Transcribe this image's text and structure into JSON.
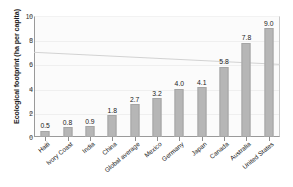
{
  "chart_data": {
    "type": "bar",
    "title": "",
    "xlabel": "",
    "ylabel": "Ecological footprint (ha per capita)",
    "categories": [
      "Haiti",
      "Ivory Coast",
      "India",
      "China",
      "Global average",
      "Mexico",
      "Germany",
      "Japan",
      "Canada",
      "Australia",
      "United States"
    ],
    "values": [
      0.5,
      0.8,
      0.9,
      1.8,
      2.7,
      3.2,
      4.0,
      4.1,
      5.8,
      7.8,
      9.0
    ],
    "value_labels": [
      "0.5",
      "0.8",
      "0.9",
      "1.8",
      "2.7",
      "3.2",
      "4.0",
      "4.1",
      "5.8",
      "7.8",
      "9.0"
    ],
    "ylim": [
      0,
      10
    ],
    "yticks": [
      0,
      2,
      4,
      6,
      8,
      10
    ],
    "ytick_labels": [
      "0",
      "2",
      "4",
      "6",
      "8",
      "10"
    ],
    "grid": true,
    "legend": "none",
    "bar_color": "#b6b6b6",
    "annotations": [
      {
        "type": "trend-line",
        "name": "biocapacity-decline-line",
        "y_start": 7.0,
        "y_end": 6.0,
        "color": "#d2d2d2"
      }
    ]
  }
}
